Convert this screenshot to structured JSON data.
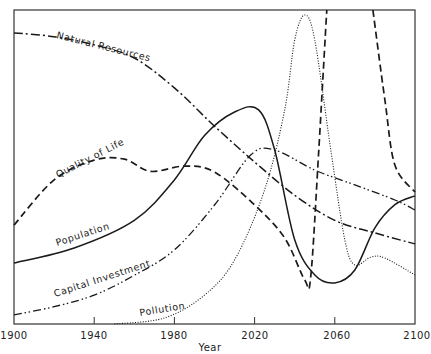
{
  "chart_data": {
    "type": "line",
    "title": "",
    "xlabel": "Year",
    "ylabel": "",
    "xlim": [
      1900,
      2100
    ],
    "ylim": [
      0,
      100
    ],
    "grid": false,
    "legend": "inline labels on curves",
    "x_ticks": [
      1900,
      1940,
      1980,
      2020,
      2060,
      2100
    ],
    "x_tick_labels": [
      "1900",
      "1940",
      "1980",
      "2020",
      "2060",
      "2100"
    ],
    "series": [
      {
        "name": "Natural Resources",
        "style": "dash-dot",
        "points": [
          [
            1900,
            92.7
          ],
          [
            1920,
            91.5
          ],
          [
            1940,
            88.9
          ],
          [
            1960,
            84.7
          ],
          [
            1980,
            75.2
          ],
          [
            2000,
            63
          ],
          [
            2020,
            51.6
          ],
          [
            2040,
            41
          ],
          [
            2060,
            33
          ],
          [
            2080,
            29
          ],
          [
            2100,
            25.5
          ]
        ]
      },
      {
        "name": "Quality of Life",
        "style": "dashed",
        "points": [
          [
            1900,
            31.5
          ],
          [
            1920,
            45.9
          ],
          [
            1940,
            52.2
          ],
          [
            1955,
            52.5
          ],
          [
            1968,
            48.6
          ],
          [
            1985,
            50.3
          ],
          [
            2000,
            48.4
          ],
          [
            2020,
            37.9
          ],
          [
            2035,
            27.4
          ],
          [
            2045,
            14
          ],
          [
            2048,
            15
          ],
          [
            2052,
            55.4
          ],
          [
            2056,
            100
          ],
          null,
          [
            2079,
            100
          ],
          [
            2085,
            71.3
          ],
          [
            2090,
            50.6
          ],
          [
            2100,
            42
          ]
        ]
      },
      {
        "name": "Population",
        "style": "solid",
        "points": [
          [
            1900,
            19.4
          ],
          [
            1930,
            24.2
          ],
          [
            1960,
            33
          ],
          [
            1980,
            45.9
          ],
          [
            1995,
            60
          ],
          [
            2010,
            67.5
          ],
          [
            2022,
            68.2
          ],
          [
            2030,
            55.4
          ],
          [
            2040,
            26.8
          ],
          [
            2050,
            15.6
          ],
          [
            2060,
            13.1
          ],
          [
            2070,
            17.2
          ],
          [
            2080,
            30.6
          ],
          [
            2090,
            38
          ],
          [
            2100,
            40.8
          ]
        ]
      },
      {
        "name": "Capital Investment",
        "style": "dash-dot-dot",
        "points": [
          [
            1900,
            2.9
          ],
          [
            1920,
            5.5
          ],
          [
            1940,
            9.2
          ],
          [
            1960,
            15.5
          ],
          [
            1980,
            23.6
          ],
          [
            2000,
            37.9
          ],
          [
            2018,
            53.8
          ],
          [
            2030,
            55.4
          ],
          [
            2050,
            49
          ],
          [
            2070,
            44.3
          ],
          [
            2090,
            39.5
          ],
          [
            2100,
            36.3
          ]
        ]
      },
      {
        "name": "Pollution",
        "style": "dotted",
        "points": [
          [
            1950,
            0
          ],
          [
            1975,
            1.9
          ],
          [
            1995,
            9.2
          ],
          [
            2010,
            20.4
          ],
          [
            2025,
            42.7
          ],
          [
            2035,
            68.2
          ],
          [
            2040,
            90.4
          ],
          [
            2045,
            98.4
          ],
          [
            2050,
            90.4
          ],
          [
            2058,
            55.4
          ],
          [
            2065,
            26.8
          ],
          [
            2070,
            18.8
          ],
          [
            2078,
            21.3
          ],
          [
            2085,
            21
          ],
          [
            2100,
            15.6
          ]
        ]
      }
    ],
    "annotations": [
      {
        "text": "Natural Resources",
        "x": 1929,
        "y": 89,
        "angle": 14
      },
      {
        "text": "Quality of Life",
        "x": 1918,
        "y": 50,
        "angle": -27
      },
      {
        "text": "Population",
        "x": 1916,
        "y": 24,
        "angle": -18
      },
      {
        "text": "Capital Investment",
        "x": 1920,
        "y": 6,
        "angle": -18
      },
      {
        "text": "Pollution",
        "x": 1962,
        "y": 6,
        "angle": -9
      }
    ]
  },
  "labels": {
    "natural_resources": "Natural Resources",
    "quality_of_life": "Quality of Life",
    "population": "Population",
    "capital_investment": "Capital Investment",
    "pollution": "Pollution",
    "x_axis": "Year",
    "ticks": [
      "1900",
      "1940",
      "1980",
      "2020",
      "2060",
      "2100"
    ]
  }
}
